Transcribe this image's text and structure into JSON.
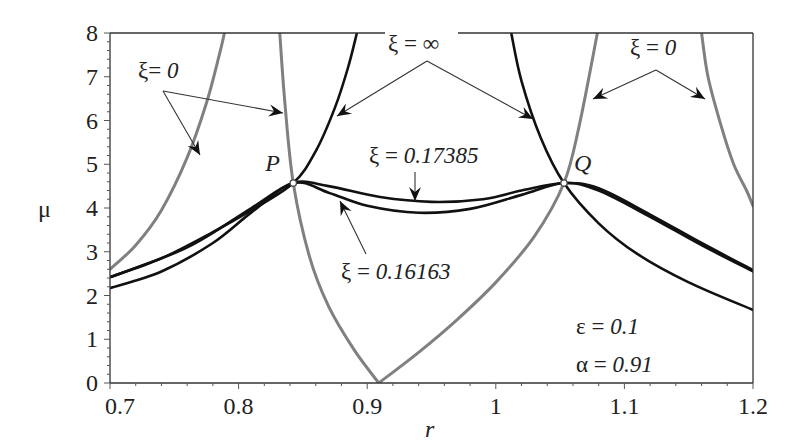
{
  "chart_data": {
    "type": "line",
    "title": "",
    "xlabel": "r",
    "ylabel": "μ",
    "xlim": [
      0.7,
      1.2
    ],
    "ylim": [
      0,
      8
    ],
    "xticks": [
      "0.7",
      "0.8",
      "0.9",
      "1",
      "1.1",
      "1.2"
    ],
    "yticks": [
      "0",
      "1",
      "2",
      "3",
      "4",
      "5",
      "6",
      "7",
      "8"
    ],
    "grid": false,
    "legend": null,
    "parameters": {
      "epsilon": "0.1",
      "alpha": "0.91"
    },
    "points": [
      {
        "name": "P",
        "r": 0.8425,
        "mu": 4.57
      },
      {
        "name": "Q",
        "r": 1.053,
        "mu": 4.57
      }
    ],
    "series": [
      {
        "name": "ξ = 0 (left branch)",
        "color": "#808080",
        "style": "gray",
        "x": [
          0.7,
          0.72,
          0.74,
          0.76,
          0.775,
          0.785,
          0.789
        ],
        "y": [
          2.6,
          3.15,
          3.95,
          5.15,
          6.4,
          7.5,
          8.0
        ]
      },
      {
        "name": "ξ = 0 (V through P)",
        "color": "#808080",
        "style": "gray",
        "x": [
          0.832,
          0.836,
          0.8425,
          0.855,
          0.87,
          0.89,
          0.909
        ],
        "y": [
          8.0,
          6.4,
          4.57,
          2.9,
          1.75,
          0.75,
          0.0
        ]
      },
      {
        "name": "ξ = 0 (V through Q)",
        "color": "#808080",
        "style": "gray",
        "x": [
          0.909,
          0.94,
          0.97,
          1.0,
          1.03,
          1.053,
          1.065,
          1.079
        ],
        "y": [
          0.0,
          0.7,
          1.45,
          2.3,
          3.35,
          4.57,
          5.9,
          8.0
        ]
      },
      {
        "name": "ξ = 0 (right branch)",
        "color": "#808080",
        "style": "gray",
        "x": [
          1.16,
          1.165,
          1.175,
          1.185,
          1.195,
          1.2
        ],
        "y": [
          8.0,
          7.0,
          5.9,
          5.0,
          4.4,
          4.05
        ]
      },
      {
        "name": "ξ = ∞ (left)",
        "color": "#111111",
        "style": "black",
        "x": [
          0.7,
          0.74,
          0.78,
          0.81,
          0.8425,
          0.86,
          0.875,
          0.885,
          0.892
        ],
        "y": [
          2.42,
          2.85,
          3.45,
          3.95,
          4.57,
          5.3,
          6.3,
          7.2,
          8.0
        ]
      },
      {
        "name": "ξ = ∞ (right)",
        "color": "#111111",
        "style": "black",
        "x": [
          1.012,
          1.02,
          1.035,
          1.053,
          1.08,
          1.11,
          1.15,
          1.2
        ],
        "y": [
          8.0,
          6.9,
          5.6,
          4.57,
          3.65,
          2.95,
          2.3,
          1.67
        ]
      },
      {
        "name": "ξ = 0.17385",
        "color": "#111111",
        "style": "black",
        "x": [
          0.7,
          0.76,
          0.81,
          0.8425,
          0.87,
          0.91,
          0.95,
          0.99,
          1.02,
          1.053,
          1.08,
          1.12,
          1.16,
          1.2
        ],
        "y": [
          2.42,
          3.1,
          4.0,
          4.57,
          4.5,
          4.25,
          4.14,
          4.2,
          4.4,
          4.57,
          4.45,
          3.85,
          3.2,
          2.58
        ]
      },
      {
        "name": "ξ = 0.16163",
        "color": "#111111",
        "style": "black",
        "x": [
          0.7,
          0.74,
          0.78,
          0.81,
          0.8425,
          0.87,
          0.9,
          0.94,
          0.98,
          1.02,
          1.053,
          1.08,
          1.12,
          1.16,
          1.2
        ],
        "y": [
          2.17,
          2.55,
          3.2,
          3.9,
          4.57,
          4.35,
          4.05,
          3.89,
          3.98,
          4.3,
          4.57,
          4.4,
          3.8,
          3.15,
          2.55
        ]
      }
    ],
    "annotations": [
      {
        "text_sym": "ξ",
        "text_eq": "= ",
        "text_val": "0",
        "x": 138,
        "y": 78
      },
      {
        "text_sym": "ξ",
        "text_eq": " = ",
        "text_val": "∞",
        "x": 388,
        "y": 51
      },
      {
        "text_sym": "ξ",
        "text_eq": " = ",
        "text_val": "0",
        "x": 630,
        "y": 55
      },
      {
        "text_sym": "ξ",
        "text_eq": " = ",
        "text_val": "0.17385",
        "x": 369,
        "y": 163
      },
      {
        "text_sym": "ξ",
        "text_eq": " = ",
        "text_val": "0.16163",
        "x": 341,
        "y": 279
      },
      {
        "text_sym": "ε",
        "text_eq": " = ",
        "text_val": "0.1",
        "x": 576,
        "y": 334
      },
      {
        "text_sym": "α",
        "text_eq": " = ",
        "text_val": "0.91",
        "x": 576,
        "y": 372
      }
    ]
  },
  "arrows": [
    {
      "from": [
        163,
        91
      ],
      "to": [
        200,
        155
      ]
    },
    {
      "from": [
        163,
        91
      ],
      "to": [
        283,
        113
      ]
    },
    {
      "from": [
        427,
        61
      ],
      "to": [
        337,
        116
      ]
    },
    {
      "from": [
        427,
        61
      ],
      "to": [
        533,
        119
      ]
    },
    {
      "from": [
        656,
        70
      ],
      "to": [
        593,
        99
      ]
    },
    {
      "from": [
        656,
        70
      ],
      "to": [
        705,
        99
      ]
    },
    {
      "from": [
        415,
        172
      ],
      "to": [
        415,
        201
      ]
    },
    {
      "from": [
        366,
        254
      ],
      "to": [
        340,
        201
      ]
    }
  ]
}
